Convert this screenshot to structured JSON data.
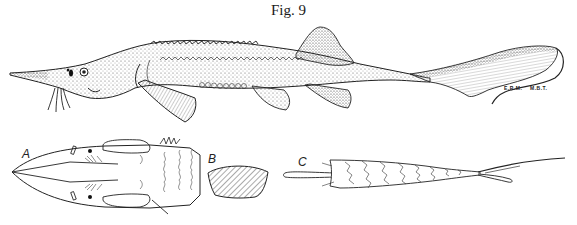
{
  "figure": {
    "title": "Fig. 9",
    "main_illustration": {
      "subject": "sturgeon-lateral-view",
      "credits": [
        "E.R.M.",
        "M.B.T."
      ]
    },
    "panels": [
      {
        "label": "A",
        "subject": "head-ventral-view"
      },
      {
        "label": "B",
        "subject": "scute-detail"
      },
      {
        "label": "C",
        "subject": "caudal-peduncle-dorsal-view"
      }
    ]
  },
  "colors": {
    "ink": "#222222",
    "stipple": "#555555",
    "background": "#ffffff"
  }
}
